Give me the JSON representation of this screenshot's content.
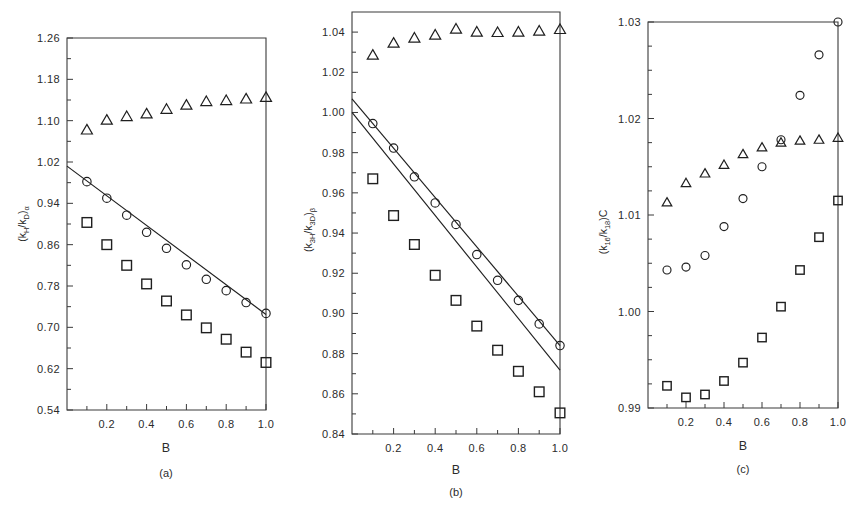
{
  "figure": {
    "background": "#ffffff",
    "ink_color": "#1f1f1f",
    "width": 864,
    "height": 507
  },
  "chart_data": [
    {
      "id": "panel-a",
      "type": "scatter",
      "title": "",
      "caption": "(a)",
      "xlabel": "B",
      "ylabel": "(kH/kD)α",
      "ylabel_parts": {
        "open": "(k",
        "sub1": "H",
        "slash": "/k",
        "sub2": "D",
        "close": ")",
        "subscript": "α"
      },
      "xlim": [
        0.0,
        1.0
      ],
      "ylim": [
        0.54,
        1.26
      ],
      "xticks": [
        0.2,
        0.4,
        0.6,
        0.8,
        1.0
      ],
      "xticklabels": [
        "0.2",
        "0.4",
        "0.6",
        "0.8",
        "1.0"
      ],
      "xminor": [
        0.1,
        0.3,
        0.5,
        0.7,
        0.9
      ],
      "yticks": [
        0.54,
        0.62,
        0.7,
        0.78,
        0.86,
        0.94,
        1.02,
        1.1,
        1.18,
        1.26
      ],
      "yticklabels": [
        "0.54",
        "0.62",
        "0.70",
        "0.78",
        "0.86",
        "0.94",
        "1.02",
        "1.10",
        "1.18",
        "1.26"
      ],
      "grid": false,
      "legend": "none",
      "x": [
        0.1,
        0.2,
        0.3,
        0.4,
        0.5,
        0.6,
        0.7,
        0.8,
        0.9,
        1.0
      ],
      "series": [
        {
          "name": "triangle",
          "marker": "triangle",
          "values": [
            1.082,
            1.101,
            1.108,
            1.113,
            1.122,
            1.13,
            1.137,
            1.139,
            1.142,
            1.145
          ]
        },
        {
          "name": "circle",
          "marker": "circle",
          "values": [
            0.982,
            0.95,
            0.917,
            0.884,
            0.853,
            0.821,
            0.793,
            0.771,
            0.748,
            0.727
          ]
        },
        {
          "name": "square",
          "marker": "square",
          "values": [
            0.903,
            0.86,
            0.82,
            0.784,
            0.751,
            0.724,
            0.699,
            0.677,
            0.652,
            0.632
          ]
        }
      ],
      "lines": [
        {
          "name": "fit-line",
          "x": [
            0.0,
            1.0
          ],
          "y": [
            1.012,
            0.725
          ]
        }
      ]
    },
    {
      "id": "panel-b",
      "type": "scatter",
      "title": "",
      "caption": "(b)",
      "xlabel": "B",
      "ylabel": "(k3H/k3D)β",
      "ylabel_parts": {
        "open": "(k",
        "sub1": "3H",
        "slash": "/k",
        "sub2": "3D",
        "close": ")",
        "subscript": "β"
      },
      "xlim": [
        0.0,
        1.0
      ],
      "ylim": [
        0.84,
        1.05
      ],
      "xticks": [
        0.2,
        0.4,
        0.6,
        0.8,
        1.0
      ],
      "xticklabels": [
        "0.2",
        "0.4",
        "0.6",
        "0.8",
        "1.0"
      ],
      "xminor": [
        0.1,
        0.3,
        0.5,
        0.7,
        0.9
      ],
      "yticks": [
        0.84,
        0.86,
        0.88,
        0.9,
        0.92,
        0.94,
        0.96,
        0.98,
        1.0,
        1.02,
        1.04
      ],
      "yticklabels": [
        "0.84",
        "0.86",
        "0.88",
        "0.90",
        "0.92",
        "0.94",
        "0.96",
        "0.98",
        "1.00",
        "1.02",
        "1.04"
      ],
      "grid": false,
      "legend": "none",
      "x": [
        0.1,
        0.2,
        0.3,
        0.4,
        0.5,
        0.6,
        0.7,
        0.8,
        0.9,
        1.0
      ],
      "series": [
        {
          "name": "triangle",
          "marker": "triangle",
          "values": [
            1.0285,
            1.0345,
            1.037,
            1.0385,
            1.0415,
            1.04,
            1.0398,
            1.04,
            1.0405,
            1.0413
          ]
        },
        {
          "name": "circle",
          "marker": "circle",
          "values": [
            0.9945,
            0.9823,
            0.968,
            0.955,
            0.9443,
            0.9293,
            0.9165,
            0.9065,
            0.8948,
            0.884
          ]
        },
        {
          "name": "square",
          "marker": "square",
          "values": [
            0.967,
            0.9487,
            0.9343,
            0.919,
            0.9065,
            0.8937,
            0.8817,
            0.8712,
            0.861,
            0.8505
          ]
        }
      ],
      "lines": [
        {
          "name": "upper-fit-line",
          "x": [
            0.0,
            1.0
          ],
          "y": [
            1.0068,
            0.884
          ]
        },
        {
          "name": "lower-fit-line",
          "x": [
            0.0,
            1.0
          ],
          "y": [
            1.0,
            0.8718
          ]
        }
      ]
    },
    {
      "id": "panel-c",
      "type": "scatter",
      "title": "",
      "caption": "(c)",
      "xlabel": "B",
      "ylabel": "(k16/k18)C",
      "ylabel_parts": {
        "open": "(k",
        "sub1": "16",
        "slash": "/k",
        "sub2": "18",
        "close": ")",
        "subscript": "C"
      },
      "xlim": [
        0.0,
        1.0
      ],
      "ylim": [
        0.99,
        1.03
      ],
      "xticks": [
        0.2,
        0.4,
        0.6,
        0.8,
        1.0
      ],
      "xticklabels": [
        "0.2",
        "0.4",
        "0.6",
        "0.8",
        "1.0"
      ],
      "xminor": [
        0.1,
        0.3,
        0.5,
        0.7,
        0.9
      ],
      "yticks": [
        0.99,
        1.0,
        1.01,
        1.02,
        1.03
      ],
      "yticklabels": [
        "0.99",
        "1.00",
        "1.01",
        "1.02",
        "1.03"
      ],
      "yminor": [
        0.9925,
        0.995,
        0.9975,
        1.0025,
        1.005,
        1.0075,
        1.0125,
        1.015,
        1.0175,
        1.0225,
        1.025,
        1.0275
      ],
      "grid": false,
      "legend": "none",
      "x": [
        0.1,
        0.2,
        0.3,
        0.4,
        0.5,
        0.6,
        0.7,
        0.8,
        0.9,
        1.0
      ],
      "series": [
        {
          "name": "triangle",
          "marker": "triangle",
          "values": [
            1.0113,
            1.0133,
            1.0143,
            1.0152,
            1.0163,
            1.017,
            1.0175,
            1.0177,
            1.0178,
            1.018
          ]
        },
        {
          "name": "circle",
          "marker": "circle",
          "values": [
            1.0043,
            1.0046,
            1.0058,
            1.0088,
            1.0117,
            1.015,
            1.0178,
            1.0224,
            1.0266,
            1.03
          ]
        },
        {
          "name": "square",
          "marker": "square",
          "values": [
            0.9923,
            0.9911,
            0.9914,
            0.9928,
            0.9947,
            0.9973,
            1.0005,
            1.0043,
            1.0077,
            1.0115
          ]
        }
      ],
      "lines": []
    }
  ]
}
